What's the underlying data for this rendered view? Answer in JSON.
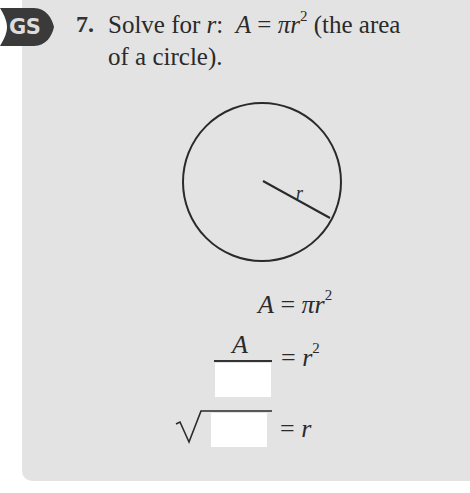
{
  "badge": {
    "label": "GS",
    "icon": "guided-solution-badge",
    "color": "#3a3a3a"
  },
  "question": {
    "number": "7.",
    "prefix": "Solve for ",
    "variable": "r",
    "colon": ":",
    "formula_lhs": "A",
    "formula_eq": " = ",
    "formula_pi": "π",
    "formula_r": "r",
    "formula_exp": "2",
    "suffix_line1": " (the area",
    "line2": "of a circle)."
  },
  "diagram": {
    "type": "circle",
    "radius_label": "r",
    "center": [
      262,
      182
    ],
    "radius_px": 79,
    "radius_end": [
      330,
      218
    ]
  },
  "steps": [
    {
      "lhs": "A",
      "eq": "=",
      "rhs_pi": "π",
      "rhs_var": "r",
      "rhs_exp": "2"
    },
    {
      "numerator": "A",
      "denominator_blank": "",
      "eq": "=",
      "rhs_var": "r",
      "rhs_exp": "2"
    },
    {
      "radical_blank": "",
      "radical_symbol": "√",
      "eq": "=",
      "rhs_var": "r"
    }
  ],
  "colors": {
    "panel": "#e3e3e3",
    "blank": "#ffffff",
    "text": "#2a2a2a"
  }
}
